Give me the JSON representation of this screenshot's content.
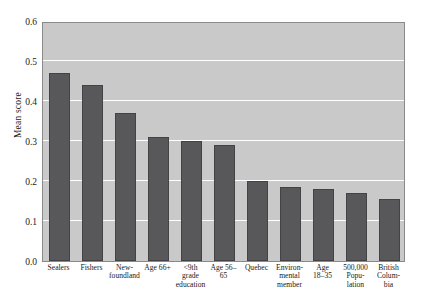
{
  "chart_data": {
    "type": "bar",
    "title": "",
    "xlabel": "",
    "ylabel": "Mean score",
    "ylim": [
      0.0,
      0.6
    ],
    "ytick_labels": [
      "0.0",
      "0.1",
      "0.2",
      "0.3",
      "0.4",
      "0.5",
      "0.6"
    ],
    "ytick_values": [
      0.0,
      0.1,
      0.2,
      0.3,
      0.4,
      0.5,
      0.6
    ],
    "gridlines": [
      0.1,
      0.2,
      0.3,
      0.4,
      0.5
    ],
    "grid": true,
    "legend": "none",
    "bar_color": "#58585a",
    "plot_background": "#c9c9c9",
    "gridline_color": "#ffffff",
    "categories": [
      "Sealers",
      "Fishers",
      "New-foundland",
      "Age 66+",
      "<9th grade education",
      "Age 56–65",
      "Quebec",
      "Environ-mental member",
      "Age 18–35",
      "500,000 Popu-lation",
      "British Colum-bia"
    ],
    "category_lines": [
      [
        "Sealers"
      ],
      [
        "Fishers"
      ],
      [
        "New-",
        "foundland"
      ],
      [
        "Age 66+"
      ],
      [
        "<9th",
        "grade",
        "education"
      ],
      [
        "Age 56–",
        "65"
      ],
      [
        "Quebec"
      ],
      [
        "Environ-",
        "mental",
        "member"
      ],
      [
        "Age",
        "18–35"
      ],
      [
        "500,000",
        "Popu-",
        "lation"
      ],
      [
        "British",
        "Colum-",
        "bia"
      ]
    ],
    "values": [
      0.47,
      0.44,
      0.37,
      0.31,
      0.3,
      0.29,
      0.2,
      0.185,
      0.18,
      0.17,
      0.155
    ]
  }
}
